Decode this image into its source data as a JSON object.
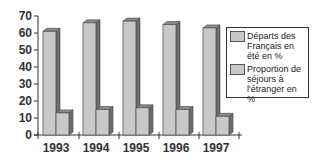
{
  "chart_data": {
    "type": "bar",
    "title": "",
    "xlabel": "",
    "ylabel": "",
    "ylim": [
      0,
      70
    ],
    "yticks": [
      0,
      10,
      20,
      30,
      40,
      50,
      60,
      70
    ],
    "grid": false,
    "legend_position": "right",
    "categories": [
      "1993",
      "1994",
      "1995",
      "1996",
      "1997"
    ],
    "series": [
      {
        "name": "Départs des Français en été en %",
        "values": [
          61,
          66,
          67,
          65,
          63
        ]
      },
      {
        "name": "Proportion de séjours à l'étranger en %",
        "values": [
          13,
          15,
          16,
          15,
          11
        ]
      }
    ]
  },
  "legend": {
    "items": [
      {
        "label": "Départs des\nFrançais en\nété en %"
      },
      {
        "label": "Proportion de\nséjours à\nl'étranger en %"
      }
    ]
  },
  "colors": {
    "bar_face": "#c8c8c8",
    "bar_side": "#6e6e6e",
    "bar_top": "#8a8a8a",
    "axis": "#333333"
  }
}
